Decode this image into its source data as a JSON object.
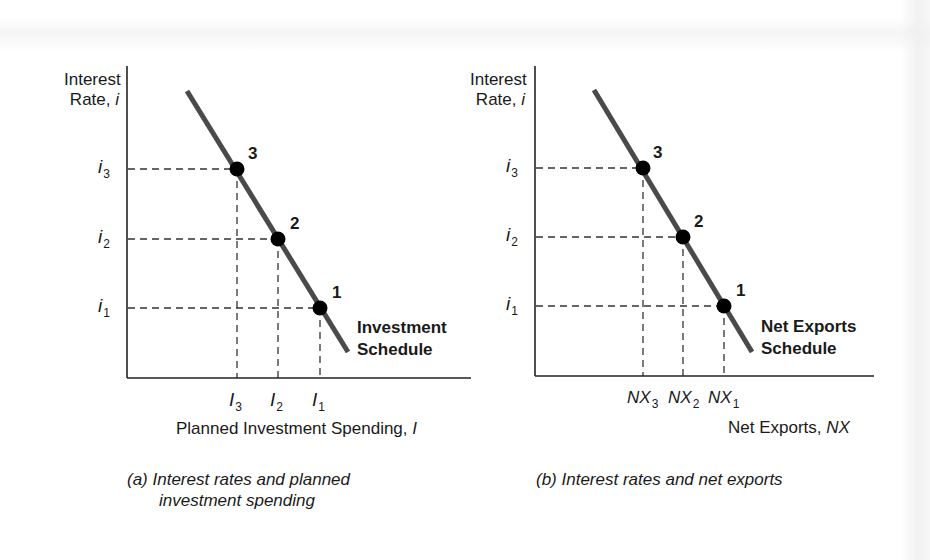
{
  "panels": [
    {
      "id": "a",
      "y_axis_label_line1": "Interest",
      "y_axis_label_line2_prefix": "Rate, ",
      "y_axis_label_line2_var": "i",
      "x_axis_label_prefix": "Planned Investment Spending, ",
      "x_axis_label_var": "I",
      "y_ticks": [
        {
          "base": "i",
          "sub": "3"
        },
        {
          "base": "i",
          "sub": "2"
        },
        {
          "base": "i",
          "sub": "1"
        }
      ],
      "x_ticks": [
        {
          "base": "I",
          "sub": "3"
        },
        {
          "base": "I",
          "sub": "2"
        },
        {
          "base": "I",
          "sub": "1"
        }
      ],
      "points": [
        "3",
        "2",
        "1"
      ],
      "curve_label_line1": "Investment",
      "curve_label_line2": "Schedule",
      "caption_line1": "(a) Interest rates and planned",
      "caption_line2": "investment spending"
    },
    {
      "id": "b",
      "y_axis_label_line1": "Interest",
      "y_axis_label_line2_prefix": "Rate, ",
      "y_axis_label_line2_var": "i",
      "x_axis_label_prefix": "Net Exports, ",
      "x_axis_label_var": "NX",
      "y_ticks": [
        {
          "base": "i",
          "sub": "3"
        },
        {
          "base": "i",
          "sub": "2"
        },
        {
          "base": "i",
          "sub": "1"
        }
      ],
      "x_ticks": [
        {
          "base": "NX",
          "sub": "3"
        },
        {
          "base": "NX",
          "sub": "2"
        },
        {
          "base": "NX",
          "sub": "1"
        }
      ],
      "points": [
        "3",
        "2",
        "1"
      ],
      "curve_label_line1": "Net Exports",
      "curve_label_line2": "Schedule",
      "caption_line1": "(b) Interest rates and net exports"
    }
  ],
  "colors": {
    "curve": "#4a4a4a",
    "axis": "#222222",
    "point": "#000000",
    "dashed": "#333333"
  }
}
